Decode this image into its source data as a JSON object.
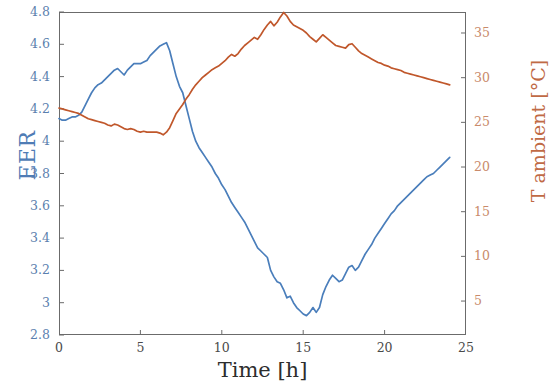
{
  "chart_data": {
    "type": "line",
    "title": "",
    "xlabel": "Time [h]",
    "ylabel": "EER",
    "y2label": "T ambient [°C]",
    "xlim": [
      0,
      25
    ],
    "ylim": [
      2.8,
      4.8
    ],
    "y2lim": [
      1.2,
      37.35
    ],
    "xticks": [
      0,
      5,
      10,
      15,
      20,
      25
    ],
    "xticklabels": [
      "0",
      "5",
      "10",
      "15",
      "20",
      "25"
    ],
    "yticks": [
      2.8,
      3.0,
      3.2,
      3.4,
      3.6,
      3.8,
      4.0,
      4.2,
      4.4,
      4.6,
      4.8
    ],
    "yticklabels": [
      "2.8",
      "3",
      "3.2",
      "3.4",
      "3.6",
      "3.8",
      "4",
      "4.2",
      "4.4",
      "4.6",
      "4.8"
    ],
    "y2ticks": [
      5,
      10,
      15,
      20,
      25,
      30,
      35
    ],
    "y2ticklabels": [
      "5",
      "10",
      "15",
      "20",
      "25",
      "30",
      "35"
    ],
    "grid": false,
    "legend": false,
    "colors": {
      "eer": "#4a7ebb",
      "tamb": "#c0572b",
      "axis": "#6b6b6b",
      "ylabel": "#4f7cb5",
      "y2label": "#c06a45"
    },
    "series": [
      {
        "name": "EER",
        "axis": "left",
        "color": "#4a7ebb",
        "x": [
          0.0,
          0.2,
          0.4,
          0.6,
          0.8,
          1.0,
          1.2,
          1.4,
          1.6,
          1.8,
          2.0,
          2.2,
          2.4,
          2.6,
          2.8,
          3.0,
          3.2,
          3.4,
          3.6,
          3.8,
          4.0,
          4.2,
          4.4,
          4.6,
          4.8,
          5.0,
          5.2,
          5.4,
          5.6,
          5.8,
          6.0,
          6.2,
          6.4,
          6.6,
          6.8,
          7.0,
          7.2,
          7.4,
          7.6,
          7.8,
          8.0,
          8.2,
          8.4,
          8.6,
          8.8,
          9.0,
          9.2,
          9.4,
          9.6,
          9.8,
          10.0,
          10.2,
          10.4,
          10.6,
          10.8,
          11.0,
          11.2,
          11.4,
          11.6,
          11.8,
          12.0,
          12.2,
          12.4,
          12.6,
          12.8,
          13.0,
          13.2,
          13.4,
          13.6,
          13.8,
          14.0,
          14.2,
          14.4,
          14.6,
          14.8,
          15.0,
          15.2,
          15.4,
          15.6,
          15.8,
          16.0,
          16.2,
          16.4,
          16.6,
          16.8,
          17.0,
          17.2,
          17.4,
          17.6,
          17.8,
          18.0,
          18.2,
          18.4,
          18.6,
          18.8,
          19.0,
          19.2,
          19.4,
          19.6,
          19.8,
          20.0,
          20.2,
          20.4,
          20.6,
          20.8,
          21.0,
          21.2,
          21.4,
          21.6,
          21.8,
          22.0,
          22.2,
          22.4,
          22.6,
          22.8,
          23.0,
          23.2,
          23.4,
          23.6,
          23.8,
          24.0
        ],
        "y": [
          4.14,
          4.13,
          4.13,
          4.14,
          4.15,
          4.15,
          4.16,
          4.18,
          4.22,
          4.26,
          4.3,
          4.33,
          4.35,
          4.36,
          4.38,
          4.4,
          4.42,
          4.44,
          4.45,
          4.43,
          4.41,
          4.44,
          4.46,
          4.48,
          4.48,
          4.48,
          4.49,
          4.5,
          4.53,
          4.55,
          4.57,
          4.59,
          4.6,
          4.61,
          4.56,
          4.48,
          4.4,
          4.34,
          4.3,
          4.22,
          4.14,
          4.06,
          4.0,
          3.96,
          3.93,
          3.9,
          3.87,
          3.84,
          3.8,
          3.77,
          3.73,
          3.7,
          3.66,
          3.62,
          3.59,
          3.56,
          3.53,
          3.5,
          3.46,
          3.42,
          3.38,
          3.34,
          3.32,
          3.3,
          3.28,
          3.2,
          3.16,
          3.13,
          3.12,
          3.08,
          3.03,
          3.04,
          3.0,
          2.97,
          2.95,
          2.93,
          2.92,
          2.94,
          2.97,
          2.94,
          2.97,
          3.05,
          3.1,
          3.14,
          3.17,
          3.15,
          3.13,
          3.14,
          3.18,
          3.22,
          3.23,
          3.2,
          3.22,
          3.26,
          3.3,
          3.33,
          3.36,
          3.4,
          3.43,
          3.46,
          3.49,
          3.52,
          3.55,
          3.57,
          3.6,
          3.62,
          3.64,
          3.66,
          3.68,
          3.7,
          3.72,
          3.74,
          3.76,
          3.78,
          3.79,
          3.8,
          3.82,
          3.84,
          3.86,
          3.88,
          3.9
        ]
      },
      {
        "name": "T ambient",
        "axis": "right",
        "color": "#c0572b",
        "x": [
          0.0,
          0.2,
          0.4,
          0.6,
          0.8,
          1.0,
          1.2,
          1.4,
          1.6,
          1.8,
          2.0,
          2.2,
          2.4,
          2.6,
          2.8,
          3.0,
          3.2,
          3.4,
          3.6,
          3.8,
          4.0,
          4.2,
          4.4,
          4.6,
          4.8,
          5.0,
          5.2,
          5.4,
          5.6,
          5.8,
          6.0,
          6.2,
          6.4,
          6.6,
          6.8,
          7.0,
          7.2,
          7.4,
          7.6,
          7.8,
          8.0,
          8.2,
          8.4,
          8.6,
          8.8,
          9.0,
          9.2,
          9.4,
          9.6,
          9.8,
          10.0,
          10.2,
          10.4,
          10.6,
          10.8,
          11.0,
          11.2,
          11.4,
          11.6,
          11.8,
          12.0,
          12.2,
          12.4,
          12.6,
          12.8,
          13.0,
          13.2,
          13.4,
          13.6,
          13.8,
          14.0,
          14.2,
          14.4,
          14.6,
          14.8,
          15.0,
          15.2,
          15.4,
          15.6,
          15.8,
          16.0,
          16.2,
          16.4,
          16.6,
          16.8,
          17.0,
          17.2,
          17.4,
          17.6,
          17.8,
          18.0,
          18.2,
          18.4,
          18.6,
          18.8,
          19.0,
          19.2,
          19.4,
          19.6,
          19.8,
          20.0,
          20.2,
          20.4,
          20.6,
          20.8,
          21.0,
          21.2,
          21.4,
          21.6,
          21.8,
          22.0,
          22.2,
          22.4,
          22.6,
          22.8,
          23.0,
          23.2,
          23.4,
          23.6,
          23.8,
          24.0
        ],
        "y": [
          26.6,
          26.5,
          26.4,
          26.3,
          26.2,
          26.1,
          26.0,
          25.8,
          25.6,
          25.4,
          25.3,
          25.2,
          25.1,
          25.0,
          24.9,
          24.7,
          24.6,
          24.8,
          24.7,
          24.5,
          24.3,
          24.2,
          24.3,
          24.2,
          24.0,
          23.9,
          24.0,
          23.9,
          23.9,
          23.9,
          23.9,
          23.8,
          23.6,
          23.9,
          24.4,
          25.2,
          26.0,
          26.5,
          27.0,
          27.6,
          28.1,
          28.7,
          29.2,
          29.6,
          30.0,
          30.3,
          30.6,
          30.9,
          31.1,
          31.3,
          31.6,
          31.9,
          32.3,
          32.6,
          32.4,
          32.7,
          33.2,
          33.6,
          33.9,
          34.2,
          34.5,
          34.3,
          34.8,
          35.4,
          35.9,
          36.3,
          35.8,
          36.2,
          36.8,
          37.3,
          36.9,
          36.3,
          35.9,
          35.7,
          35.5,
          35.3,
          35.0,
          34.6,
          34.3,
          34.0,
          34.4,
          34.8,
          34.5,
          34.2,
          33.9,
          33.6,
          33.5,
          33.4,
          33.3,
          33.7,
          33.8,
          33.4,
          33.0,
          32.7,
          32.5,
          32.3,
          32.1,
          31.9,
          31.7,
          31.6,
          31.4,
          31.3,
          31.1,
          31.0,
          30.9,
          30.8,
          30.6,
          30.5,
          30.4,
          30.3,
          30.2,
          30.1,
          30.0,
          29.9,
          29.8,
          29.7,
          29.6,
          29.5,
          29.4,
          29.3,
          29.2
        ]
      }
    ]
  },
  "axes": {
    "x_label": "Time [h]",
    "y_label": "EER",
    "y2_label": "T ambient [°C]"
  }
}
